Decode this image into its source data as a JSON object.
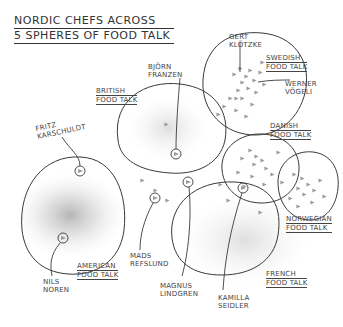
{
  "title": {
    "line1": "NORDIC CHEFS ACROSS",
    "line2": "5 SPHERES OF FOOD TALK"
  },
  "spheres": [
    {
      "id": "american",
      "line1": "AMERICAN",
      "line2": "FOOD TALK"
    },
    {
      "id": "british",
      "line1": "BRITISH",
      "line2": "FOOD TALK"
    },
    {
      "id": "swedish",
      "line1": "SWEDISH",
      "line2": "FOOD TALK"
    },
    {
      "id": "danish",
      "line1": "DANISH",
      "line2": "FOOD TALK"
    },
    {
      "id": "norwegian",
      "line1": "NORWEGIAN",
      "line2": "FOOD TALK"
    },
    {
      "id": "french",
      "line1": "FRENCH",
      "line2": "FOOD TALK"
    }
  ],
  "chefs": [
    {
      "id": "fritz",
      "line1": "FRITZ",
      "line2": "KARSCHULDT"
    },
    {
      "id": "bjorn",
      "line1": "BJÖRN",
      "line2": "FRANZEN"
    },
    {
      "id": "gert",
      "line1": "GERT",
      "line2": "KLÖTZKE"
    },
    {
      "id": "werner",
      "line1": "WERNER",
      "line2": "VÖGELI"
    },
    {
      "id": "nils",
      "line1": "NILS",
      "line2": "NOREN"
    },
    {
      "id": "mads",
      "line1": "MADS",
      "line2": "REFSLUND"
    },
    {
      "id": "magnus",
      "line1": "MAGNUS",
      "line2": "LINDGREN"
    },
    {
      "id": "kamilla",
      "line1": "KAMILLA",
      "line2": "SEIDLER"
    }
  ],
  "colors": {
    "ink": "#3a3a3a",
    "marker": "#9a9a9a",
    "cloud": "#b8b8b8",
    "background": "#ffffff"
  }
}
